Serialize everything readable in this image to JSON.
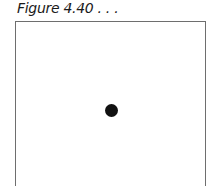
{
  "figure": {
    "caption": "Figure 4.40 . . .",
    "frame_color": "#6e6e6e",
    "dot": {
      "color": "#111111",
      "shape": "filled-circle"
    }
  }
}
